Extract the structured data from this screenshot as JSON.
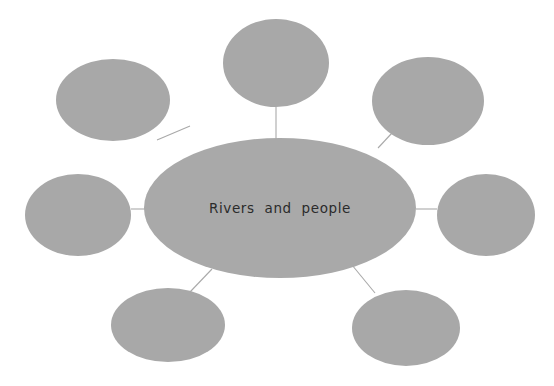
{
  "diagram": {
    "type": "mind-map",
    "title": "Rivers and people",
    "background_color": "#ffffff",
    "node_fill_color": "#a8a8a8",
    "connector_color": "#a9a9a9",
    "text_color": "#2b2b2b",
    "central_node": {
      "label": "Rivers and people",
      "shape": "ellipse",
      "cx": 280,
      "cy": 208,
      "rx": 136,
      "ry": 70
    },
    "branch_nodes": [
      {
        "label": "",
        "name": "branch-node-top-left",
        "cx": 113,
        "cy": 100,
        "rx": 57,
        "ry": 41
      },
      {
        "label": "",
        "name": "branch-node-top",
        "cx": 276,
        "cy": 63,
        "rx": 53,
        "ry": 44
      },
      {
        "label": "",
        "name": "branch-node-top-right",
        "cx": 428,
        "cy": 101,
        "rx": 56,
        "ry": 44
      },
      {
        "label": "",
        "name": "branch-node-left",
        "cx": 78,
        "cy": 215,
        "rx": 53,
        "ry": 41
      },
      {
        "label": "",
        "name": "branch-node-right",
        "cx": 486,
        "cy": 215,
        "rx": 49,
        "ry": 41
      },
      {
        "label": "",
        "name": "branch-node-bottom-left",
        "cx": 168,
        "cy": 325,
        "rx": 57,
        "ry": 37
      },
      {
        "label": "",
        "name": "branch-node-bottom-right",
        "cx": 406,
        "cy": 328,
        "rx": 54,
        "ry": 38
      }
    ],
    "connectors": [
      {
        "name": "connector-top-left",
        "x1": 157,
        "y1": 140,
        "x2": 190,
        "y2": 126
      },
      {
        "name": "connector-top",
        "x1": 276,
        "y1": 139,
        "x2": 276,
        "y2": 107
      },
      {
        "name": "connector-top-right",
        "x1": 378,
        "y1": 148,
        "x2": 392,
        "y2": 133
      },
      {
        "name": "connector-left",
        "x1": 145,
        "y1": 209,
        "x2": 131,
        "y2": 209
      },
      {
        "name": "connector-right",
        "x1": 416,
        "y1": 209,
        "x2": 437,
        "y2": 209
      },
      {
        "name": "connector-bottom-left",
        "x1": 212,
        "y1": 269,
        "x2": 190,
        "y2": 292
      },
      {
        "name": "connector-bottom-right",
        "x1": 352,
        "y1": 265,
        "x2": 375,
        "y2": 293
      }
    ]
  }
}
